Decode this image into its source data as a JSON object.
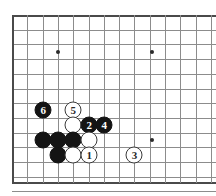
{
  "board": {
    "title": "Go board diagram",
    "type": "go-diagram",
    "grid": {
      "origin_x": 12,
      "origin_y": 15,
      "spacing_x": 15.3,
      "spacing_y": 14.7,
      "cols": 14,
      "rows": 12,
      "line_color": "#8c8c8c",
      "edge_color": "#4a4a4a",
      "background": "#ffffff"
    },
    "star_points": [
      {
        "name": "star-upper-left",
        "col": 3,
        "row": 2.5
      },
      {
        "name": "star-upper-right",
        "col": 9.15,
        "row": 2.5
      },
      {
        "name": "star-lower-right",
        "col": 9.15,
        "row": 8.5
      }
    ],
    "stones": [
      {
        "name": "white-stone-move-5",
        "color": "white",
        "label": "5",
        "col": 4,
        "row": 6.45
      },
      {
        "name": "black-stone-move-6",
        "color": "black",
        "label": "6",
        "col": 2.05,
        "row": 6.45
      },
      {
        "name": "white-stone-plain-a",
        "color": "white",
        "label": "",
        "col": 4,
        "row": 7.47
      },
      {
        "name": "black-stone-move-2",
        "color": "black",
        "label": "2",
        "col": 5.05,
        "row": 7.47
      },
      {
        "name": "black-stone-move-4",
        "color": "black",
        "label": "4",
        "col": 6.03,
        "row": 7.47
      },
      {
        "name": "black-stone-plain-b",
        "color": "black",
        "label": "",
        "col": 2.05,
        "row": 8.5
      },
      {
        "name": "black-stone-plain-c",
        "color": "black",
        "label": "",
        "col": 3.02,
        "row": 8.5
      },
      {
        "name": "black-stone-plain-d",
        "color": "black",
        "label": "",
        "col": 4,
        "row": 8.5
      },
      {
        "name": "white-stone-plain-e",
        "color": "white",
        "label": "",
        "col": 5.05,
        "row": 8.5
      },
      {
        "name": "black-stone-plain-f",
        "color": "black",
        "label": "",
        "col": 3.02,
        "row": 9.5
      },
      {
        "name": "white-stone-plain-g",
        "color": "white",
        "label": "",
        "col": 4,
        "row": 9.5
      },
      {
        "name": "white-stone-move-1",
        "color": "white",
        "label": "1",
        "col": 5.05,
        "row": 9.5
      },
      {
        "name": "white-stone-move-3",
        "color": "white",
        "label": "3",
        "col": 8,
        "row": 9.5
      }
    ],
    "move_sequence": [
      {
        "move": "1",
        "color": "white"
      },
      {
        "move": "2",
        "color": "black"
      },
      {
        "move": "3",
        "color": "white"
      },
      {
        "move": "4",
        "color": "black"
      },
      {
        "move": "5",
        "color": "white"
      },
      {
        "move": "6",
        "color": "black"
      }
    ]
  }
}
